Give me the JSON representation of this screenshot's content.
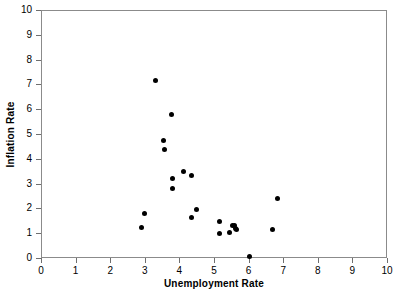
{
  "chart_data": {
    "type": "scatter",
    "title": "",
    "xlabel": "Unemployment Rate",
    "ylabel": "Inflation Rate",
    "xlim": [
      0,
      10
    ],
    "ylim": [
      0,
      10
    ],
    "xticks": [
      0,
      1,
      2,
      3,
      4,
      5,
      6,
      7,
      8,
      9,
      10
    ],
    "yticks": [
      0,
      1,
      2,
      3,
      4,
      5,
      6,
      7,
      8,
      9,
      10
    ],
    "xtick_labels": [
      "0",
      "1",
      "2",
      "3",
      "4",
      "5",
      "6",
      "7",
      "8",
      "9",
      "10"
    ],
    "ytick_labels": [
      "0",
      "1",
      "2",
      "3",
      "4",
      "5",
      "6",
      "7",
      "8",
      "9",
      "10"
    ],
    "grid": false,
    "legend": null,
    "marker": "filled-circle",
    "marker_color": "#000000",
    "marker_size": 5,
    "points": [
      {
        "x": 2.9,
        "y": 1.25
      },
      {
        "x": 3.0,
        "y": 1.78
      },
      {
        "x": 3.3,
        "y": 7.16
      },
      {
        "x": 3.55,
        "y": 4.72
      },
      {
        "x": 3.57,
        "y": 4.36
      },
      {
        "x": 3.78,
        "y": 5.8
      },
      {
        "x": 3.79,
        "y": 3.2
      },
      {
        "x": 3.8,
        "y": 2.82
      },
      {
        "x": 4.12,
        "y": 3.5
      },
      {
        "x": 4.34,
        "y": 3.32
      },
      {
        "x": 4.36,
        "y": 1.63
      },
      {
        "x": 4.49,
        "y": 1.94
      },
      {
        "x": 5.15,
        "y": 1.48
      },
      {
        "x": 5.17,
        "y": 0.99
      },
      {
        "x": 5.46,
        "y": 1.02
      },
      {
        "x": 5.53,
        "y": 1.3
      },
      {
        "x": 5.6,
        "y": 1.33
      },
      {
        "x": 5.63,
        "y": 1.18
      },
      {
        "x": 5.66,
        "y": 1.16
      },
      {
        "x": 6.02,
        "y": 0.05
      },
      {
        "x": 6.7,
        "y": 1.14
      },
      {
        "x": 6.84,
        "y": 2.38
      }
    ]
  },
  "axes": {
    "frame_color": "#8b8b8b",
    "tick_color": "#6f6f6f",
    "background": "#ffffff"
  }
}
